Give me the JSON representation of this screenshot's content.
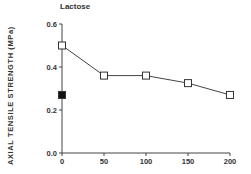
{
  "chart_data": {
    "type": "line",
    "title": "Lactose",
    "xlabel": "",
    "ylabel": "AXIAL  TENSILE  STRENGTH  (MPa)",
    "xlim": [
      0,
      200
    ],
    "ylim": [
      0.0,
      0.6
    ],
    "x_ticks": [
      "0",
      "50",
      "100",
      "150",
      "200"
    ],
    "y_ticks": [
      "0.0",
      "0.2",
      "0.4",
      "0.6"
    ],
    "grid": false,
    "legend": null,
    "series": [
      {
        "name": "open-squares",
        "marker": "open-square",
        "line": true,
        "x": [
          0,
          50,
          100,
          150,
          200
        ],
        "y": [
          0.5,
          0.36,
          0.36,
          0.325,
          0.27
        ]
      },
      {
        "name": "filled-square",
        "marker": "filled-square",
        "line": false,
        "x": [
          0
        ],
        "y": [
          0.27
        ]
      }
    ]
  }
}
